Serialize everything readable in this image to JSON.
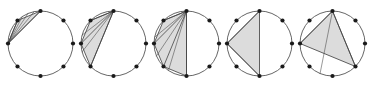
{
  "figure": {
    "width": 386,
    "height": 87,
    "background_color": "#ffffff",
    "circle_stroke_color": "#555555",
    "circle_stroke_width": 0.9,
    "chord_stroke_color": "#444444",
    "chord_stroke_width": 0.8,
    "region_fill_color": "#dcdcdc",
    "region_stroke_color": "#3a3a3a",
    "region_stroke_width": 0.8,
    "vertex_color": "#1a1a1a",
    "vertex_radius": 2.1,
    "points_per_circle": 8,
    "panel_count": 5
  },
  "chart_data": {
    "type": "diagram",
    "circle_radius": 32.5,
    "circle_centers": [
      {
        "cx": 40.5,
        "cy": 43.5
      },
      {
        "cx": 113.5,
        "cy": 43.5
      },
      {
        "cx": 186.5,
        "cy": 43.5
      },
      {
        "cx": 259.5,
        "cy": 43.5
      },
      {
        "cx": 332.5,
        "cy": 43.5
      }
    ],
    "vertex_angles_deg": [
      270,
      315,
      0,
      45,
      90,
      135,
      180,
      225
    ],
    "vertex_labels": [
      "top",
      "upper-right",
      "right",
      "lower-right",
      "bottom",
      "lower-left",
      "left",
      "upper-left"
    ],
    "panels": [
      {
        "index": 1,
        "label": "panel-1",
        "region_vertices": [
          "top",
          "upper-left",
          "left"
        ],
        "fan_apex": "left",
        "fan_targets": [
          "top",
          "upper-left"
        ],
        "fan_intermediate_count": 3,
        "region_area_relative": 0.05
      },
      {
        "index": 2,
        "label": "panel-2",
        "region_vertices": [
          "top",
          "upper-left",
          "left",
          "lower-left"
        ],
        "fan_apex": "top",
        "fan_targets": [
          "upper-left",
          "left",
          "lower-left"
        ],
        "fan_intermediate_count": 2,
        "region_area_relative": 0.18
      },
      {
        "index": 3,
        "label": "panel-3",
        "region_vertices": [
          "top",
          "upper-left",
          "left",
          "lower-left",
          "bottom"
        ],
        "fan_apex": "top",
        "fan_targets": [
          "upper-left",
          "left",
          "lower-left",
          "bottom"
        ],
        "fan_intermediate_count": 3,
        "region_area_relative": 0.32
      },
      {
        "index": 4,
        "label": "panel-4",
        "region_vertices": [
          "top",
          "left",
          "bottom"
        ],
        "fan_apex": "left",
        "fan_targets": [
          "top",
          "bottom"
        ],
        "fan_intermediate_count": 1,
        "region_area_relative": 0.32
      },
      {
        "index": 5,
        "label": "panel-5",
        "region_vertices": [
          "top",
          "left",
          "lower-right"
        ],
        "fan_apex": "top",
        "fan_targets": [
          "left",
          "lower-right"
        ],
        "fan_intermediate_count": 1,
        "region_area_relative": 0.41
      }
    ]
  }
}
